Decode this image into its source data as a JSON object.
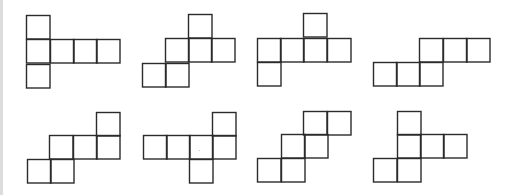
{
  "diagram": {
    "title": "",
    "stroke_color": "#2b2b2b",
    "background": "#ffffff",
    "edge_strip_color": "#dcdcdc",
    "nets": [
      {
        "id": 1,
        "row": 0,
        "col": 0,
        "squares": [
          [
            26,
            15
          ],
          [
            26,
            39
          ],
          [
            50,
            39
          ],
          [
            73,
            39
          ],
          [
            96,
            39
          ],
          [
            26,
            64
          ]
        ]
      },
      {
        "id": 2,
        "row": 0,
        "col": 1,
        "squares": [
          [
            188,
            14
          ],
          [
            165,
            38
          ],
          [
            188,
            38
          ],
          [
            211,
            38
          ],
          [
            142,
            63
          ],
          [
            165,
            63
          ]
        ]
      },
      {
        "id": 3,
        "row": 0,
        "col": 2,
        "squares": [
          [
            303,
            13
          ],
          [
            257,
            38
          ],
          [
            280,
            38
          ],
          [
            303,
            38
          ],
          [
            327,
            38
          ],
          [
            257,
            62
          ]
        ]
      },
      {
        "id": 4,
        "row": 0,
        "col": 3,
        "squares": [
          [
            419,
            38
          ],
          [
            443,
            38
          ],
          [
            466,
            38
          ],
          [
            373,
            62
          ],
          [
            396,
            62
          ],
          [
            419,
            62
          ]
        ]
      },
      {
        "id": 5,
        "row": 1,
        "col": 0,
        "squares": [
          [
            96,
            112
          ],
          [
            49,
            135
          ],
          [
            73,
            135
          ],
          [
            96,
            135
          ],
          [
            27,
            159
          ],
          [
            50,
            159
          ]
        ]
      },
      {
        "id": 6,
        "row": 1,
        "col": 1,
        "squares": [
          [
            212,
            112
          ],
          [
            143,
            135
          ],
          [
            166,
            135
          ],
          [
            189,
            135
          ],
          [
            212,
            135
          ],
          [
            189,
            159
          ]
        ]
      },
      {
        "id": 7,
        "row": 1,
        "col": 2,
        "squares": [
          [
            303,
            111
          ],
          [
            327,
            111
          ],
          [
            281,
            134
          ],
          [
            304,
            134
          ],
          [
            257,
            158
          ],
          [
            281,
            158
          ]
        ]
      },
      {
        "id": 8,
        "row": 1,
        "col": 3,
        "squares": [
          [
            397,
            111
          ],
          [
            397,
            134
          ],
          [
            420,
            134
          ],
          [
            443,
            134
          ],
          [
            373,
            158
          ],
          [
            397,
            158
          ]
        ]
      }
    ],
    "square_size": 23.5
  }
}
